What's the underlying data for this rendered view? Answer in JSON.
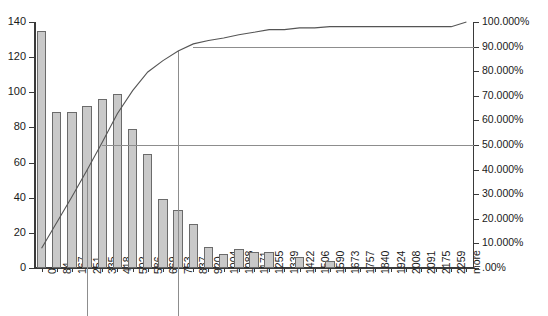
{
  "chart_data": {
    "type": "bar",
    "title": "",
    "subtitle": "",
    "xlabel": "",
    "ylabel": "",
    "y2label": "",
    "grid": false,
    "legend_position": "none",
    "categories": [
      "0",
      "84",
      "167",
      "251",
      "335",
      "418",
      "502",
      "586",
      "669",
      "753",
      "837",
      "920",
      "1004",
      "1088",
      "1171",
      "1255",
      "1339",
      "1422",
      "1506",
      "1590",
      "1673",
      "1757",
      "1840",
      "1924",
      "2008",
      "2091",
      "2175",
      "2259",
      "more"
    ],
    "values": [
      135,
      89,
      89,
      92,
      96,
      99,
      79,
      65,
      39,
      33,
      25,
      12,
      8,
      11,
      9,
      9,
      0,
      6,
      0,
      4,
      0,
      0,
      0,
      0,
      0,
      0,
      0,
      0,
      0
    ],
    "ylim": [
      0,
      140
    ],
    "yticks": [
      0,
      20,
      40,
      60,
      80,
      100,
      120,
      140
    ],
    "ytick_labels": [
      "0",
      "20",
      "40",
      "60",
      "80",
      "100",
      "120",
      "140"
    ],
    "y2lim": [
      0,
      100
    ],
    "y2ticks": [
      0,
      10,
      20,
      30,
      40,
      50,
      60,
      70,
      80,
      90,
      100
    ],
    "y2tick_labels": [
      ".00%",
      "10.000%",
      "20.000%",
      "30.000%",
      "40.000%",
      "50.000%",
      "60.000%",
      "70.000%",
      "80.000%",
      "90.000%",
      "100.000%"
    ],
    "series": [
      {
        "name": "Frequency",
        "type": "bar",
        "values": [
          135,
          89,
          89,
          92,
          96,
          99,
          79,
          65,
          39,
          33,
          25,
          12,
          8,
          11,
          9,
          9,
          0,
          6,
          0,
          4,
          0,
          0,
          0,
          0,
          0,
          0,
          0,
          0,
          0
        ]
      },
      {
        "name": "Cumulative %",
        "type": "line",
        "axis": "y2",
        "values": [
          8.0,
          18.5,
          29.0,
          39.8,
          51.1,
          62.8,
          72.1,
          79.7,
          84.3,
          88.2,
          91.1,
          92.5,
          93.5,
          94.8,
          95.8,
          96.9,
          96.9,
          97.6,
          97.6,
          98.1,
          98.1,
          98.1,
          98.1,
          98.1,
          98.1,
          98.1,
          98.1,
          98.1,
          100.0
        ]
      }
    ],
    "annotations": {
      "reference_lines": [
        {
          "name": "cumulative-50-percent-line",
          "orientation": "horizontal",
          "axis": "y2",
          "value": 50
        },
        {
          "name": "cumulative-90-percent-line",
          "orientation": "horizontal",
          "axis": "y2",
          "value": 90
        },
        {
          "name": "category-251-line",
          "orientation": "vertical",
          "category": "251"
        },
        {
          "name": "category-753-line",
          "orientation": "vertical",
          "category": "753"
        }
      ]
    }
  }
}
